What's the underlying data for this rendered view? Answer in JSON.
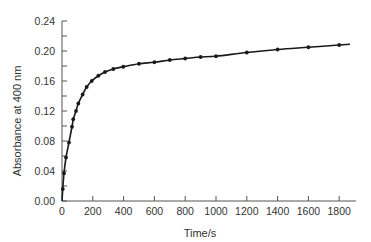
{
  "chart_data": {
    "type": "scatter",
    "title": "",
    "xlabel": "Time/s",
    "ylabel": "Absorbance at 400 nm",
    "xlim": [
      0,
      1800
    ],
    "ylim": [
      0.0,
      0.24
    ],
    "x_ticks": [
      0,
      200,
      400,
      600,
      800,
      1000,
      1200,
      1400,
      1600,
      1800
    ],
    "x_tick_labels": [
      "0",
      "200",
      "400",
      "600",
      "800",
      "1000",
      "1200",
      "1400",
      "1600",
      "1800"
    ],
    "y_ticks": [
      0.0,
      0.04,
      0.08,
      0.12,
      0.16,
      0.2,
      0.24
    ],
    "y_tick_labels": [
      "0.00",
      "0.04",
      "0.08",
      "0.12",
      "0.16",
      "0.20",
      "0.24"
    ],
    "y_minor_step": 0.02,
    "grid": false,
    "legend": null,
    "series": [
      {
        "name": "measured",
        "style": "points with fitted smooth line",
        "x": [
          5,
          13,
          26,
          45,
          65,
          73,
          91,
          106,
          134,
          160,
          193,
          236,
          279,
          333,
          398,
          500,
          600,
          700,
          800,
          900,
          1000,
          1200,
          1400,
          1600,
          1800
        ],
        "y": [
          0.016,
          0.037,
          0.058,
          0.078,
          0.099,
          0.109,
          0.12,
          0.13,
          0.142,
          0.152,
          0.16,
          0.167,
          0.172,
          0.176,
          0.179,
          0.183,
          0.185,
          0.188,
          0.19,
          0.192,
          0.193,
          0.198,
          0.202,
          0.205,
          0.208
        ]
      }
    ],
    "line_extends_to_x": 1870,
    "line_end_y": 0.209
  },
  "colors": {
    "axis": "#555555",
    "line": "#1a1a1a",
    "marker": "#1a1a1a",
    "text": "#333333"
  }
}
